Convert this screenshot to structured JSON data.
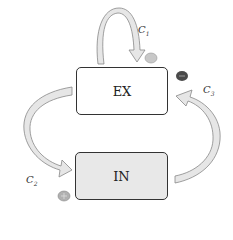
{
  "diagram": {
    "nodes": [
      {
        "id": "ex",
        "label": "EX",
        "fill": "#ffffff"
      },
      {
        "id": "in",
        "label": "IN",
        "fill": "#e8e8e8"
      }
    ],
    "edges": [
      {
        "id": "c1",
        "label": "C",
        "sub": "1",
        "from": "ex",
        "to": "ex",
        "sign": "neutral",
        "sign_color": "#c8c8c8"
      },
      {
        "id": "c2",
        "label": "C",
        "sub": "2",
        "from": "ex",
        "to": "in",
        "sign": "+",
        "sign_color": "#b0b0b0"
      },
      {
        "id": "c3",
        "label": "C",
        "sub": "3",
        "from": "in",
        "to": "ex",
        "sign": "−",
        "sign_color": "#4a4a4a"
      }
    ],
    "arrow_fill": "#e6e6e6",
    "arrow_stroke": "#888888"
  }
}
